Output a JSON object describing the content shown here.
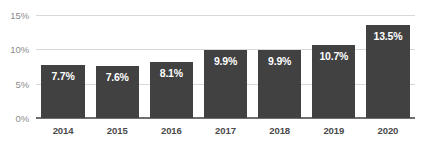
{
  "chart_data": {
    "type": "bar",
    "title": "",
    "subtitle": "",
    "xlabel": "",
    "ylabel": "",
    "categories": [
      "2014",
      "2015",
      "2016",
      "2017",
      "2018",
      "2019",
      "2020"
    ],
    "values": [
      7.7,
      7.6,
      8.1,
      9.9,
      9.9,
      10.7,
      13.5
    ],
    "value_labels": [
      "7.7%",
      "7.6%",
      "8.1%",
      "9.9%",
      "9.9%",
      "10.7%",
      "13.5%"
    ],
    "ylim": [
      0,
      15
    ],
    "yticks": [
      0,
      5,
      10,
      15
    ],
    "ytick_labels": [
      "0%",
      "5%",
      "10%",
      "15%"
    ],
    "grid": true,
    "legend": "none",
    "series": [
      {
        "name": "",
        "values": [
          7.7,
          7.6,
          8.1,
          9.9,
          9.9,
          10.7,
          13.5
        ]
      }
    ],
    "colors": {
      "bar": "#414141",
      "value_label": "#ffffff",
      "gridline": "#d8d8d8",
      "axis_line": "#6e6e6e",
      "ytick_label": "#8c8c8c",
      "xtick_label": "#4a4a4a",
      "background": "#ffffff"
    }
  }
}
